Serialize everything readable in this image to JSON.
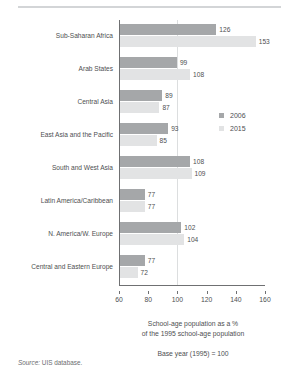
{
  "chart_data": {
    "type": "bar",
    "orientation": "horizontal",
    "title": "",
    "xlabel": "School-age population as a %\nof the 1995 school-age population",
    "ylabel": "",
    "xlim": [
      60,
      160
    ],
    "xticks": [
      60,
      80,
      100,
      120,
      140,
      160
    ],
    "grid": false,
    "reference_line": 100,
    "legend_position": "right",
    "categories": [
      "Sub-Saharan Africa",
      "Arab States",
      "Central Asia",
      "East Asia and the Pacific",
      "South and West Asia",
      "Latin America/Caribbean",
      "N. America/W. Europe",
      "Central and Eastern Europe"
    ],
    "series": [
      {
        "name": "2006",
        "color": "#a5a7a9",
        "values": [
          126,
          99,
          89,
          93,
          108,
          77,
          102,
          77
        ]
      },
      {
        "name": "2015",
        "color": "#e2e3e4",
        "values": [
          153,
          108,
          87,
          85,
          109,
          77,
          104,
          72
        ]
      }
    ]
  },
  "axis_title": {
    "line1": "School-age population as a %",
    "line2": "of the 1995 school-age population"
  },
  "notes": {
    "base_year": "Base year (1995) = 100",
    "source_word": "Source:",
    "source_text": " UIS database."
  },
  "legend": {
    "items": [
      {
        "label": "2006",
        "color": "#a5a7a9"
      },
      {
        "label": "2015",
        "color": "#e2e3e4"
      }
    ]
  },
  "colors": {
    "series_2006": "#a5a7a9",
    "series_2015": "#e2e3e4",
    "axis": "#6f7072",
    "reference_line": "#dcdedf",
    "text": "#4e4f51",
    "top_rule": "#d3d5d7"
  }
}
